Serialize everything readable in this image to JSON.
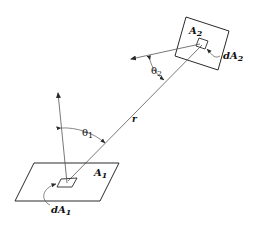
{
  "diagram": {
    "type": "radiation view factor geometry",
    "colors": {
      "stroke": "#2a2a2a",
      "thin_stroke": "#555555",
      "background": "#ffffff"
    },
    "labels": {
      "A2": {
        "main": "A",
        "sub": "2"
      },
      "dA2": {
        "main": "dA",
        "sub": "2"
      },
      "theta2": {
        "main": "θ",
        "sub": "2"
      },
      "r": {
        "main": "r"
      },
      "theta1": {
        "main": "θ",
        "sub": "1"
      },
      "A1": {
        "main": "A",
        "sub": "1"
      },
      "dA1": {
        "main": "dA",
        "sub": "1"
      }
    },
    "elements": [
      "surface A1 (parallelogram, lower left)",
      "differential area dA1 on A1",
      "normal vector from dA1",
      "angle theta1 between normal and r",
      "line r connecting dA1 and dA2",
      "surface A2 (tilted square, upper right)",
      "differential area dA2 on A2",
      "normal vector from dA2",
      "angle theta2 between normal and r"
    ]
  }
}
